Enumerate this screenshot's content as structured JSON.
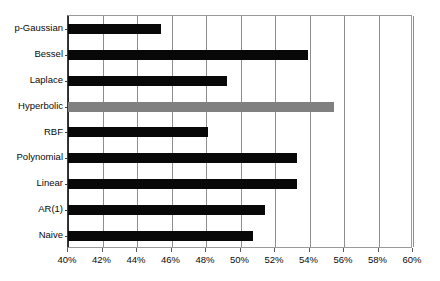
{
  "chart_data": {
    "type": "bar",
    "orientation": "horizontal",
    "title": "",
    "subtitle": "",
    "xlabel": "",
    "ylabel": "",
    "xlim": [
      40,
      60
    ],
    "xtick_step": 2,
    "xtick_labels": [
      "40%",
      "42%",
      "44%",
      "46%",
      "48%",
      "50%",
      "52%",
      "54%",
      "56%",
      "58%",
      "60%"
    ],
    "xtick_values": [
      40,
      42,
      44,
      46,
      48,
      50,
      52,
      54,
      56,
      58,
      60
    ],
    "grid": true,
    "legend": "none",
    "categories": [
      "p-Gaussian",
      "Bessel",
      "Laplace",
      "Hyperbolic",
      "RBF",
      "Polynomial",
      "Linear",
      "AR(1)",
      "Naive"
    ],
    "values": [
      45.4,
      53.9,
      49.2,
      55.4,
      48.1,
      53.3,
      53.3,
      51.4,
      50.7
    ],
    "bars": [
      {
        "label": "p-Gaussian",
        "value": 45.4,
        "color": "#080808",
        "highlight": false
      },
      {
        "label": "Bessel",
        "value": 53.9,
        "color": "#080808",
        "highlight": false
      },
      {
        "label": "Laplace",
        "value": 49.2,
        "color": "#080808",
        "highlight": false
      },
      {
        "label": "Hyperbolic",
        "value": 55.4,
        "color": "#808080",
        "highlight": true
      },
      {
        "label": "RBF",
        "value": 48.1,
        "color": "#080808",
        "highlight": false
      },
      {
        "label": "Polynomial",
        "value": 53.3,
        "color": "#080808",
        "highlight": false
      },
      {
        "label": "Linear",
        "value": 53.3,
        "color": "#080808",
        "highlight": false
      },
      {
        "label": "AR(1)",
        "value": 51.4,
        "color": "#080808",
        "highlight": false
      },
      {
        "label": "Naive",
        "value": 50.7,
        "color": "#080808",
        "highlight": false
      }
    ],
    "colors": {
      "bar_default": "#080808",
      "bar_highlight": "#808080",
      "grid": "#8d8d8d",
      "axis": "#2b2b2b",
      "background": "#ffffff",
      "text": "#0a0a0a"
    }
  }
}
